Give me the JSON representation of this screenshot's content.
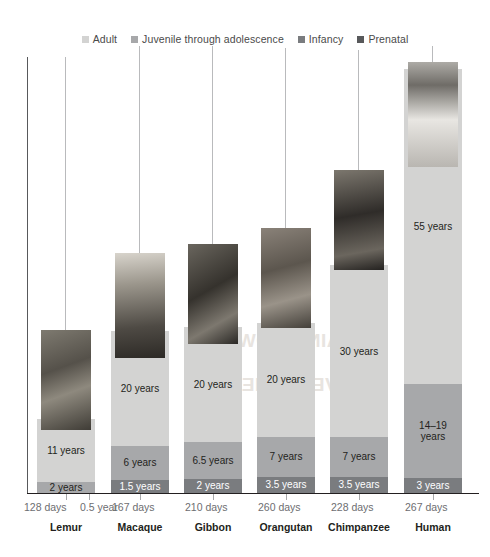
{
  "chart_data": {
    "type": "bar",
    "title": "",
    "xlabel": "",
    "ylabel": "",
    "stacked": true,
    "categories": [
      "Lemur",
      "Macaque",
      "Gibbon",
      "Orangutan",
      "Chimpanzee",
      "Human"
    ],
    "series": [
      {
        "name": "Adult",
        "color": "#d3d3d2",
        "values": [
          11,
          20,
          20,
          20,
          30,
          55
        ],
        "labels": [
          "11 years",
          "20 years",
          "20 years",
          "20 years",
          "30 years",
          "55 years"
        ]
      },
      {
        "name": "Juvenile through adolescence",
        "color": "#a7a8aa",
        "values": [
          2,
          6,
          6.5,
          7,
          7,
          16.5
        ],
        "labels": [
          "2 years",
          "6 years",
          "6.5 years",
          "7 years",
          "7 years",
          "14–19 years"
        ]
      },
      {
        "name": "Infancy",
        "color": "#7a7c7f",
        "values": [
          0.5,
          1.5,
          2,
          3.5,
          3.5,
          3
        ],
        "labels": [
          "0.5 year",
          "1.5 years",
          "2 years",
          "3.5 years",
          "3.5 years",
          "3 years"
        ]
      },
      {
        "name": "Prenatal",
        "color": "#58595b",
        "values": [
          128,
          167,
          210,
          260,
          228,
          267
        ],
        "unit": "days",
        "labels": [
          "128 days",
          "167 days",
          "210 days",
          "260 days",
          "228 days",
          "267 days"
        ]
      }
    ],
    "gestation_callouts": [
      "128 days",
      "167 days",
      "210 days",
      "260 days",
      "228 days",
      "267 days"
    ],
    "infancy_callouts": [
      "0.5 year",
      "",
      "",
      "",
      "",
      ""
    ],
    "legend_position": "top-center"
  },
  "legend": {
    "items": [
      {
        "label": "Adult",
        "color": "#d3d3d2"
      },
      {
        "label": "Juvenile through adolescence",
        "color": "#a7a8aa"
      },
      {
        "label": "Infancy",
        "color": "#7a7c7f"
      },
      {
        "label": "Prenatal",
        "color": "#58595b"
      }
    ]
  },
  "columns": [
    {
      "species": "Lemur",
      "photo": "lemur-photo",
      "segments": [
        {
          "series": "Adult",
          "label": "11 years"
        },
        {
          "series": "Juvenile",
          "label": "2 years"
        }
      ],
      "gestation": "128 days",
      "infancy_note": "0.5 year"
    },
    {
      "species": "Macaque",
      "photo": "macaque-photo",
      "segments": [
        {
          "series": "Adult",
          "label": "20 years"
        },
        {
          "series": "Juvenile",
          "label": "6 years"
        },
        {
          "series": "Infancy",
          "label": "1.5 years"
        }
      ],
      "gestation": "167 days",
      "infancy_note": ""
    },
    {
      "species": "Gibbon",
      "photo": "gibbon-photo",
      "segments": [
        {
          "series": "Adult",
          "label": "20 years"
        },
        {
          "series": "Juvenile",
          "label": "6.5 years"
        },
        {
          "series": "Infancy",
          "label": "2 years"
        }
      ],
      "gestation": "210 days",
      "infancy_note": ""
    },
    {
      "species": "Orangutan",
      "photo": "orangutan-photo",
      "segments": [
        {
          "series": "Adult",
          "label": "20 years"
        },
        {
          "series": "Juvenile",
          "label": "7 years"
        },
        {
          "series": "Infancy",
          "label": "3.5 years"
        }
      ],
      "gestation": "260 days",
      "infancy_note": ""
    },
    {
      "species": "Chimpanzee",
      "photo": "chimpanzee-photo",
      "segments": [
        {
          "series": "Adult",
          "label": "30 years"
        },
        {
          "series": "Juvenile",
          "label": "7 years"
        },
        {
          "series": "Infancy",
          "label": "3.5 years"
        }
      ],
      "gestation": "228 days",
      "infancy_note": ""
    },
    {
      "species": "Human",
      "photo": "human-photo",
      "segments": [
        {
          "series": "Adult",
          "label": "55 years"
        },
        {
          "series": "Juvenile",
          "label": "14–19 years"
        },
        {
          "series": "Infancy",
          "label": "3 years"
        }
      ],
      "gestation": "267 days",
      "infancy_note": ""
    }
  ],
  "watermark": {
    "text": "BRAIN GROWTH AND DEVELOPMENT"
  }
}
